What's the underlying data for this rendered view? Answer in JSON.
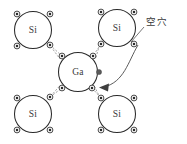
{
  "diagram": {
    "background_color": "#ffffff",
    "width": 187,
    "height": 144,
    "atom_stroke_color": "#2b2b2b",
    "bond_color": "#8c8c8c",
    "arrow_color": "#3f3f3f",
    "label_color": "#3a3a3a"
  },
  "atoms": [
    {
      "id": "si-top-left",
      "label": "Si",
      "cx": 33,
      "cy": 30,
      "r": 18.5
    },
    {
      "id": "si-top-right",
      "label": "Si",
      "cx": 117,
      "cy": 28,
      "r": 18.5
    },
    {
      "id": "ga-center",
      "label": "Ga",
      "cx": 78,
      "cy": 72,
      "r": 19.5
    },
    {
      "id": "si-bottom-left",
      "label": "Si",
      "cx": 33,
      "cy": 114,
      "r": 18.5
    },
    {
      "id": "si-bottom-right",
      "label": "Si",
      "cx": 117,
      "cy": 114,
      "r": 18.5
    }
  ],
  "electrons": [
    {
      "id": "e-tl-nw",
      "cx": 17,
      "cy": 14
    },
    {
      "id": "e-tl-ne",
      "cx": 50,
      "cy": 14
    },
    {
      "id": "e-tl-sw",
      "cx": 17,
      "cy": 46
    },
    {
      "id": "e-tl-se",
      "cx": 50,
      "cy": 45
    },
    {
      "id": "e-tr-nw",
      "cx": 101,
      "cy": 12
    },
    {
      "id": "e-tr-ne",
      "cx": 134,
      "cy": 12
    },
    {
      "id": "e-tr-sw",
      "cx": 101,
      "cy": 44
    },
    {
      "id": "e-tr-se",
      "cx": 134,
      "cy": 44
    },
    {
      "id": "e-ga-nw",
      "cx": 62,
      "cy": 56
    },
    {
      "id": "e-ga-ne",
      "cx": 93,
      "cy": 56
    },
    {
      "id": "e-ga-sw",
      "cx": 62,
      "cy": 88
    },
    {
      "id": "e-ga-se",
      "cx": 92,
      "cy": 88
    },
    {
      "id": "e-bl-nw",
      "cx": 17,
      "cy": 98
    },
    {
      "id": "e-bl-ne",
      "cx": 50,
      "cy": 97
    },
    {
      "id": "e-bl-sw",
      "cx": 17,
      "cy": 130
    },
    {
      "id": "e-bl-se",
      "cx": 50,
      "cy": 130
    },
    {
      "id": "e-br-nw",
      "cx": 101,
      "cy": 98
    },
    {
      "id": "e-br-ne",
      "cx": 134,
      "cy": 98
    },
    {
      "id": "e-br-sw",
      "cx": 101,
      "cy": 130
    },
    {
      "id": "e-br-se",
      "cx": 134,
      "cy": 130
    }
  ],
  "free_electron": {
    "id": "free-electron-dot",
    "cx": 99,
    "cy": 72,
    "r": 2.6
  },
  "bonds": [
    {
      "id": "bond-tl-ga-a",
      "x1": 50,
      "y1": 45,
      "x2": 62,
      "y2": 56
    },
    {
      "id": "bond-tl-ga-b",
      "x1": 52,
      "y1": 49,
      "x2": 60,
      "y2": 58
    },
    {
      "id": "bond-tr-ga-a",
      "x1": 101,
      "y1": 44,
      "x2": 93,
      "y2": 56
    },
    {
      "id": "bond-tr-ga-b",
      "x1": 99,
      "y1": 48,
      "x2": 95,
      "y2": 58
    },
    {
      "id": "bond-bl-ga-a",
      "x1": 50,
      "y1": 97,
      "x2": 62,
      "y2": 88
    },
    {
      "id": "bond-bl-ga-b",
      "x1": 52,
      "y1": 94,
      "x2": 60,
      "y2": 86
    },
    {
      "id": "bond-br-ga-a",
      "x1": 101,
      "y1": 98,
      "x2": 92,
      "y2": 88
    },
    {
      "id": "bond-br-ga-b",
      "x1": 99,
      "y1": 95,
      "x2": 94,
      "y2": 86
    }
  ],
  "annotation": {
    "hole_label": "空穴",
    "hole_label_x": 146,
    "hole_label_y": 22,
    "pointer": {
      "x1": 144,
      "y1": 27,
      "x2": 131,
      "y2": 42
    },
    "arrow_path": "M 138 45 C 126 64, 122 82, 103 87",
    "arrow_head_points": "103,87 112,83 110,91"
  }
}
